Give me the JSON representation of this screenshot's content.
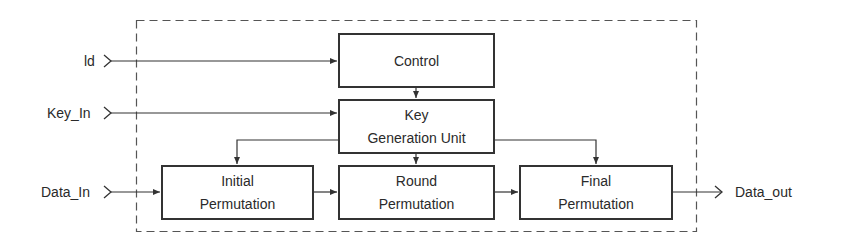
{
  "diagram": {
    "type": "block-diagram",
    "boundary": {
      "style": "dashed"
    },
    "inputs": [
      {
        "id": "ld",
        "label": "ld"
      },
      {
        "id": "key_in",
        "label": "Key_In"
      },
      {
        "id": "data_in",
        "label": "Data_In"
      }
    ],
    "outputs": [
      {
        "id": "data_out",
        "label": "Data_out"
      }
    ],
    "blocks": {
      "control": {
        "line1": "Control"
      },
      "keygen": {
        "line1": "Key",
        "line2": "Generation Unit"
      },
      "initial": {
        "line1": "Initial",
        "line2": "Permutation"
      },
      "round": {
        "line1": "Round",
        "line2": "Permutation"
      },
      "final": {
        "line1": "Final",
        "line2": "Permutation"
      }
    },
    "connections": [
      [
        "ld",
        "control"
      ],
      [
        "key_in",
        "keygen"
      ],
      [
        "control",
        "keygen"
      ],
      [
        "keygen",
        "initial"
      ],
      [
        "keygen",
        "round"
      ],
      [
        "keygen",
        "final"
      ],
      [
        "data_in",
        "initial"
      ],
      [
        "initial",
        "round"
      ],
      [
        "round",
        "final"
      ],
      [
        "final",
        "data_out"
      ]
    ]
  }
}
